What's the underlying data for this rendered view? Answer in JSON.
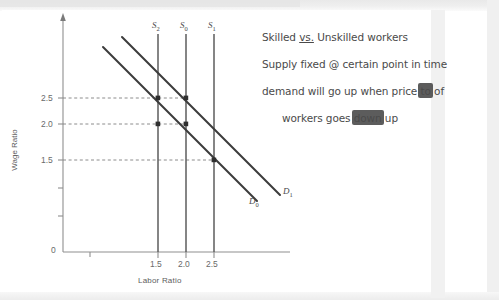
{
  "document": {
    "kind": "handwritten-economics-notes-scan"
  },
  "notes": {
    "lines": [
      {
        "segments": [
          {
            "text": "Skilled ",
            "style": "plain"
          },
          {
            "text": "vs.",
            "style": "underline"
          },
          {
            "text": " Unskilled workers",
            "style": "plain"
          }
        ],
        "indent": false
      },
      {
        "segments": [
          {
            "text": "Supply fixed @ certain point in time",
            "style": "plain"
          }
        ],
        "indent": false
      },
      {
        "segments": [
          {
            "text": "demand will go up when price ",
            "style": "plain"
          },
          {
            "text": "to",
            "style": "scribbled-out"
          },
          {
            "text": " of",
            "style": "plain"
          }
        ],
        "indent": false
      },
      {
        "segments": [
          {
            "text": "workers goes ",
            "style": "plain"
          },
          {
            "text": "down",
            "style": "scribbled-out"
          },
          {
            "text": " up",
            "style": "plain"
          }
        ],
        "indent": true
      }
    ]
  },
  "chart_data": {
    "type": "line",
    "title": "",
    "xlabel": "Labor Ratio",
    "ylabel": "Wage Ratio",
    "grid": false,
    "legend_position": "inline-curve-labels",
    "xlim": [
      0,
      3.0
    ],
    "ylim": [
      0,
      3.0
    ],
    "xticks": [
      {
        "value": 1.5,
        "label": "1.5"
      },
      {
        "value": 2.0,
        "label": "2.0"
      },
      {
        "value": 2.5,
        "label": "2.5"
      }
    ],
    "yticks": [
      {
        "value": 0.0,
        "label": "0"
      },
      {
        "value": 0.5,
        "label": ""
      },
      {
        "value": 1.0,
        "label": ""
      },
      {
        "value": 1.5,
        "label": "1.5"
      },
      {
        "value": 2.0,
        "label": "2.0"
      },
      {
        "value": 2.5,
        "label": "2.5"
      }
    ],
    "origin_label": "0",
    "series": [
      {
        "name": "S2",
        "label": "S",
        "subscript": "2",
        "kind": "vertical-supply",
        "x": 1.5,
        "description": "vertical supply curve at labor ratio 1.5"
      },
      {
        "name": "S0",
        "label": "S",
        "subscript": "0",
        "kind": "vertical-supply",
        "x": 2.0,
        "description": "vertical supply curve at labor ratio 2.0"
      },
      {
        "name": "S1",
        "label": "S",
        "subscript": "1",
        "kind": "vertical-supply",
        "x": 2.5,
        "description": "vertical supply curve at labor ratio 2.5"
      },
      {
        "name": "D0",
        "label": "D",
        "subscript": "0",
        "kind": "downward-demand",
        "points": [
          [
            0.85,
            2.95
          ],
          [
            2.55,
            1.25
          ]
        ],
        "description": "original downward-sloping demand curve"
      },
      {
        "name": "D1",
        "label": "D",
        "subscript": "1",
        "kind": "downward-demand",
        "points": [
          [
            1.15,
            3.05
          ],
          [
            2.85,
            1.35
          ]
        ],
        "description": "shifted-right demand curve"
      }
    ],
    "equilibria": [
      {
        "supply": "S2",
        "demand": "D0",
        "x": 1.5,
        "y": 2.0,
        "marked": true
      },
      {
        "supply": "S2",
        "demand": "D1",
        "x": 1.5,
        "y": 2.5,
        "marked": true
      },
      {
        "supply": "S0",
        "demand": "D1",
        "x": 2.0,
        "y": 2.5,
        "marked": true
      },
      {
        "supply": "S0",
        "demand": "D0",
        "x": 2.0,
        "y": 2.0,
        "marked": true
      },
      {
        "supply": "S1",
        "demand": "D0",
        "x": 2.5,
        "y": 1.5,
        "marked": true
      }
    ],
    "guide_lines": [
      {
        "y": 2.5,
        "from_x": 0,
        "to_x": 2.0,
        "style": "dashed"
      },
      {
        "y": 2.0,
        "from_x": 0,
        "to_x": 2.0,
        "style": "dashed"
      },
      {
        "y": 1.5,
        "from_x": 0,
        "to_x": 2.5,
        "style": "dashed"
      }
    ],
    "colors": {
      "axis": "#8a8a8a",
      "curve": "#3c3c3c",
      "supply": "#5a5a5a",
      "guide": "#7a7a7a",
      "text": "#5d5d5d",
      "ink": "#4a4a4a"
    }
  }
}
